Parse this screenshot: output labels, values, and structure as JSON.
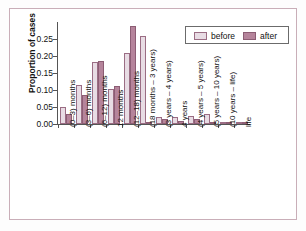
{
  "chart_data": {
    "type": "bar",
    "title": "",
    "xlabel": "",
    "ylabel": "Proportion of cases",
    "ylim": [
      0,
      0.3
    ],
    "yticks": [
      "0.00",
      "0.05",
      "0.10",
      "0.15",
      "0.20",
      "0.25"
    ],
    "ytick_values": [
      0.0,
      0.05,
      0.1,
      0.15,
      0.2,
      0.25
    ],
    "grid": false,
    "legend_position": "top-right",
    "categories": [
      "(0–3) months",
      "(3–6) months",
      "(6–12) months",
      "12 months",
      "(12–18) months",
      "(18 months – 3 years)",
      "(3 years – 4 years)",
      "4 years",
      "(4 years – 5 years)",
      "(5 years – 10 years)",
      "(10 years – life)",
      "life"
    ],
    "series": [
      {
        "name": "before",
        "color": "#e8dce4",
        "values": [
          0.05,
          0.115,
          0.181,
          0.103,
          0.209,
          0.26,
          0.021,
          0.022,
          0.023,
          0.029,
          0.007,
          0.005
        ]
      },
      {
        "name": "after",
        "color": "#b5849b",
        "values": [
          0.028,
          0.084,
          0.184,
          0.112,
          0.288,
          0.002,
          0.015,
          0.01,
          0.014,
          0.006,
          0.006,
          0.004
        ]
      }
    ]
  },
  "legend": {
    "items": [
      {
        "label": "before"
      },
      {
        "label": "after"
      }
    ]
  },
  "colors": {
    "before": "#e8dce4",
    "after": "#b5849b",
    "axis": "#555555",
    "frame": "#c9aeb8"
  }
}
